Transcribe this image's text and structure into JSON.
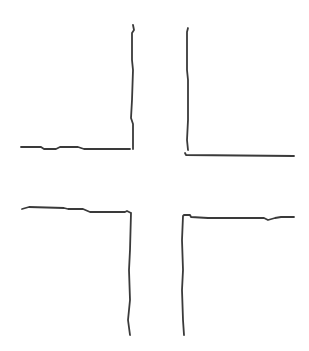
{
  "diagram": {
    "type": "intersection-sketch",
    "stroke_color": "#3a3a3a",
    "stroke_width": 1.8,
    "background": "#ffffff",
    "corners": [
      {
        "id": "top-left",
        "path": "M21,147 L41,147 L44,149 L56,149 L60,147 L78,147 L84,149 L130,149 M133,25 L134,30 L132,33 L132,60 L133,70 L132,100 L131,118 L133,124 L133,149"
      },
      {
        "id": "top-right",
        "path": "M188,28 L187,32 L187,70 L188,80 L188,120 L187,140 L188,150 M185,153 L186,155 L294,156"
      },
      {
        "id": "bottom-left",
        "path": "M22,209 L29,207 L64,208 L68,209 L83,209 L90,212 L125,212 L127,211 L131,213 M131,213 L130,250 L129,270 L130,300 L128,320 L130,335"
      },
      {
        "id": "bottom-right",
        "path": "M183,216 L184,215 L190,215 L191,217 L208,218 L264,218 L268,220 L275,218 L281,217 L294,217 M183,216 L182,240 L183,270 L182,290 L183,320 L184,335"
      }
    ]
  }
}
